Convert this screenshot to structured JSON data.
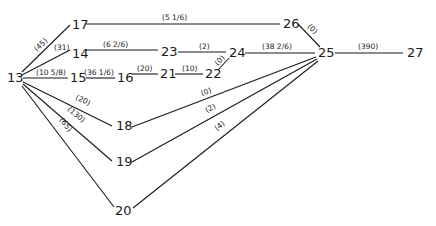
{
  "diagram": {
    "type": "network",
    "nodes": [
      {
        "id": "13",
        "label": "13",
        "x": 7,
        "y": 78
      },
      {
        "id": "14",
        "label": "14",
        "x": 72,
        "y": 54
      },
      {
        "id": "15",
        "label": "15",
        "x": 70,
        "y": 78
      },
      {
        "id": "16",
        "label": "16",
        "x": 118,
        "y": 78
      },
      {
        "id": "17",
        "label": "17",
        "x": 73,
        "y": 30
      },
      {
        "id": "18",
        "label": "18",
        "x": 117,
        "y": 131
      },
      {
        "id": "19",
        "label": "19",
        "x": 117,
        "y": 167
      },
      {
        "id": "20",
        "label": "20",
        "x": 115,
        "y": 214
      },
      {
        "id": "21",
        "label": "21",
        "x": 161,
        "y": 78
      },
      {
        "id": "22",
        "label": "22",
        "x": 206,
        "y": 78
      },
      {
        "id": "23",
        "label": "23",
        "x": 161,
        "y": 54
      },
      {
        "id": "24",
        "label": "24",
        "x": 229,
        "y": 58
      },
      {
        "id": "25",
        "label": "25",
        "x": 318,
        "y": 57
      },
      {
        "id": "26",
        "label": "26",
        "x": 283,
        "y": 27
      },
      {
        "id": "27",
        "label": "27",
        "x": 406,
        "y": 57
      }
    ],
    "edges": [
      {
        "from": "13",
        "to": "17",
        "label": "(45)"
      },
      {
        "from": "13",
        "to": "14",
        "label": "(31)"
      },
      {
        "from": "13",
        "to": "15",
        "label": "(10 5/8)"
      },
      {
        "from": "13",
        "to": "18",
        "label": "(20)"
      },
      {
        "from": "13",
        "to": "19",
        "label": "(130)"
      },
      {
        "from": "13",
        "to": "20",
        "label": "(65)"
      },
      {
        "from": "17",
        "to": "26",
        "label": "(5 1/6)"
      },
      {
        "from": "14",
        "to": "23",
        "label": "(6 2/6)"
      },
      {
        "from": "15",
        "to": "16",
        "label": "(36 1/6)"
      },
      {
        "from": "16",
        "to": "21",
        "label": "(20)"
      },
      {
        "from": "21",
        "to": "22",
        "label": "(10)"
      },
      {
        "from": "22",
        "to": "24",
        "label": "(0)"
      },
      {
        "from": "23",
        "to": "24",
        "label": "(2)"
      },
      {
        "from": "24",
        "to": "25",
        "label": "(38 2/6)"
      },
      {
        "from": "26",
        "to": "25",
        "label": "(0)"
      },
      {
        "from": "25",
        "to": "27",
        "label": "(390)"
      },
      {
        "from": "18",
        "to": "25",
        "label": "(0)"
      },
      {
        "from": "19",
        "to": "25",
        "label": "(2)"
      },
      {
        "from": "20",
        "to": "25",
        "label": "(4)"
      }
    ]
  }
}
